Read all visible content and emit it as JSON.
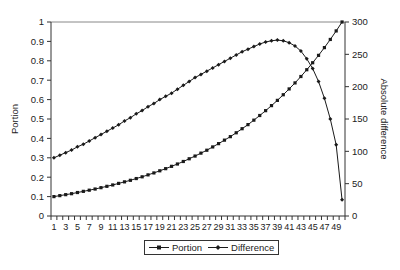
{
  "chart_data": {
    "type": "line",
    "title": "",
    "xlabel": "",
    "ylabel": "Portion",
    "y2label": "Absolute difference",
    "ylim": [
      0,
      1
    ],
    "y2lim": [
      0,
      300
    ],
    "yticks": [
      "0",
      "0.1",
      "0.2",
      "0.3",
      "0.4",
      "0.5",
      "0.6",
      "0.7",
      "0.8",
      "0.9",
      "1"
    ],
    "y2ticks": [
      "0",
      "50",
      "100",
      "150",
      "200",
      "250",
      "300"
    ],
    "x": [
      1,
      2,
      3,
      4,
      5,
      6,
      7,
      8,
      9,
      10,
      11,
      12,
      13,
      14,
      15,
      16,
      17,
      18,
      19,
      20,
      21,
      22,
      23,
      24,
      25,
      26,
      27,
      28,
      29,
      30,
      31,
      32,
      33,
      34,
      35,
      36,
      37,
      38,
      39,
      40,
      41,
      42,
      43,
      44,
      45,
      46,
      47,
      48,
      49,
      50
    ],
    "xtick_labels": [
      "1",
      "3",
      "5",
      "7",
      "9",
      "11",
      "13",
      "15",
      "17",
      "19",
      "21",
      "23",
      "25",
      "27",
      "29",
      "31",
      "33",
      "35",
      "37",
      "39",
      "41",
      "43",
      "45",
      "47",
      "49"
    ],
    "grid": false,
    "legend_position": "bottom",
    "series": [
      {
        "name": "Portion",
        "axis": "left",
        "marker": "square",
        "values": [
          0.1,
          0.105,
          0.11,
          0.115,
          0.121,
          0.127,
          0.133,
          0.139,
          0.146,
          0.153,
          0.16,
          0.168,
          0.176,
          0.184,
          0.193,
          0.202,
          0.212,
          0.222,
          0.233,
          0.244,
          0.256,
          0.268,
          0.281,
          0.295,
          0.309,
          0.324,
          0.339,
          0.356,
          0.373,
          0.391,
          0.409,
          0.429,
          0.45,
          0.471,
          0.494,
          0.518,
          0.543,
          0.569,
          0.596,
          0.625,
          0.655,
          0.686,
          0.719,
          0.754,
          0.79,
          0.828,
          0.868,
          0.91,
          0.954,
          1.0
        ]
      },
      {
        "name": "Difference",
        "axis": "right",
        "marker": "diamond",
        "values": [
          90,
          94,
          98,
          102,
          107,
          111,
          116,
          121,
          126,
          131,
          136,
          141,
          147,
          152,
          158,
          163,
          169,
          174,
          180,
          185,
          190,
          196,
          202,
          208,
          214,
          219,
          224,
          229,
          234,
          239,
          244,
          249,
          254,
          258,
          262,
          266,
          269,
          271,
          272,
          271,
          268,
          263,
          255,
          243,
          228,
          208,
          182,
          150,
          110,
          25
        ]
      }
    ]
  },
  "legend": {
    "items": [
      {
        "label": "Portion"
      },
      {
        "label": "Difference"
      }
    ]
  },
  "colors": {
    "line": "#1a1a1a",
    "axis": "#333333",
    "background": "#ffffff"
  }
}
